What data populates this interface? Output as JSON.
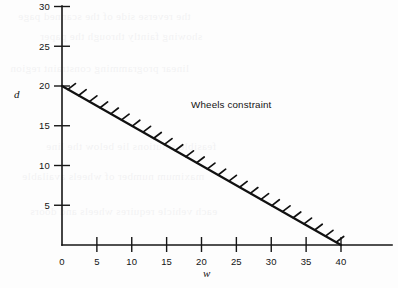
{
  "figure": {
    "background_color": "#fdfdfd",
    "ink_color": "#111111"
  },
  "chart_data": {
    "type": "line",
    "title": "",
    "subtitle": "",
    "xlabel": "w",
    "ylabel": "d",
    "xlim": [
      0,
      43.5
    ],
    "ylim": [
      0,
      32.5
    ],
    "grid": false,
    "legend_position": "none",
    "x_ticks": [
      0,
      5,
      10,
      15,
      20,
      25,
      30,
      35,
      40
    ],
    "x_tick_labels": [
      "0",
      "5",
      "10",
      "15",
      "20",
      "25",
      "30",
      "35",
      "40"
    ],
    "y_ticks": [
      5,
      10,
      15,
      20,
      25,
      30
    ],
    "y_tick_labels": [
      "5",
      "10",
      "15",
      "20",
      "25",
      "30"
    ],
    "series": [
      {
        "name": "Wheels constraint",
        "equation": "d = 20 - 0.5w",
        "style": "solid-with-hatching",
        "hatch_side": "upper-right",
        "hatch_count": 26,
        "x": [
          0,
          40
        ],
        "values": [
          20,
          0
        ],
        "points": [
          {
            "w": 0,
            "d": 20
          },
          {
            "w": 5,
            "d": 17.5
          },
          {
            "w": 10,
            "d": 15
          },
          {
            "w": 15,
            "d": 12.5
          },
          {
            "w": 20,
            "d": 10
          },
          {
            "w": 25,
            "d": 7.5
          },
          {
            "w": 30,
            "d": 5
          },
          {
            "w": 35,
            "d": 2.5
          },
          {
            "w": 40,
            "d": 0
          }
        ]
      }
    ],
    "annotations": [
      {
        "id": "wheels-constraint-label",
        "text": "Wheels constraint",
        "w": 18.5,
        "d": 17.2
      }
    ]
  },
  "bleed_through": {
    "visible": true,
    "lines": [
      "the reverse side of the scanned page",
      "showing faintly through the paper",
      "linear programming constraint region",
      "feasible solutions lie below the line",
      "maximum number of wheels available",
      "each vehicle requires wheels and doors"
    ]
  }
}
